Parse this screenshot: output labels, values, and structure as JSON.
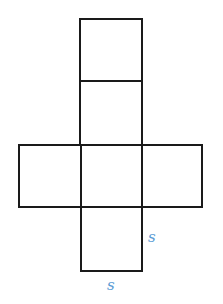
{
  "diagram": {
    "type": "cube-net",
    "stroke_color": "#1a1a1a",
    "label_color": "#5b9bd5",
    "labels": {
      "side_right": "s",
      "side_bottom": "s"
    },
    "squares": [
      {
        "name": "top",
        "x": 80,
        "y": 19,
        "size": 62
      },
      {
        "name": "upper-middle",
        "x": 80,
        "y": 81,
        "size": 64
      },
      {
        "name": "left",
        "x": 19,
        "y": 145,
        "size": 62
      },
      {
        "name": "center",
        "x": 81,
        "y": 145,
        "size": 62
      },
      {
        "name": "right",
        "x": 143,
        "y": 145,
        "size": 59
      },
      {
        "name": "bottom",
        "x": 81,
        "y": 207,
        "size": 62
      }
    ]
  }
}
